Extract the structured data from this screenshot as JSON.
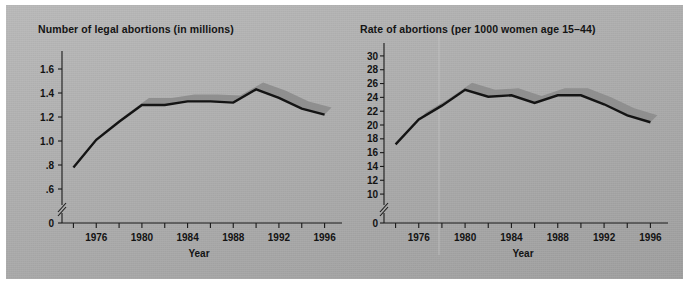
{
  "figure": {
    "background_color": "#b0b0b0",
    "border_color": "#ffffff",
    "line_color": "#141414",
    "ribbon_highlight_color": "#8f8f8f"
  },
  "chart_data": [
    {
      "id": "legal-abortions-count",
      "type": "line",
      "title": "Number of legal abortions (in millions)",
      "xlabel": "Year",
      "ylabel": "",
      "xlim": [
        1973,
        1997
      ],
      "ylim": [
        0.5,
        1.7
      ],
      "grid": false,
      "legend": "none",
      "axis_break_y": true,
      "y_ticks": [
        "0",
        ".6",
        ".8",
        "1.0",
        "1.2",
        "1.4",
        "1.6"
      ],
      "y_tick_values": [
        0,
        0.6,
        0.8,
        1.0,
        1.2,
        1.4,
        1.6
      ],
      "x_ticks": [
        "1976",
        "1980",
        "1984",
        "1988",
        "1992",
        "1996"
      ],
      "x_tick_values": [
        1976,
        1980,
        1984,
        1988,
        1992,
        1996
      ],
      "x_minor_tick_values": [
        1974,
        1978,
        1982,
        1986,
        1990,
        1994
      ],
      "x": [
        1974,
        1976,
        1978,
        1980,
        1982,
        1984,
        1986,
        1988,
        1990,
        1992,
        1994,
        1996
      ],
      "values": [
        0.78,
        1.01,
        1.16,
        1.3,
        1.3,
        1.33,
        1.33,
        1.32,
        1.43,
        1.36,
        1.27,
        1.22
      ]
    },
    {
      "id": "abortion-rate",
      "type": "line",
      "title": "Rate of abortions (per 1000 women age 15–44)",
      "xlabel": "Year",
      "ylabel": "",
      "xlim": [
        1973,
        1997
      ],
      "ylim": [
        9,
        31
      ],
      "grid": false,
      "legend": "none",
      "axis_break_y": true,
      "y_ticks": [
        "0",
        "10",
        "12",
        "14",
        "16",
        "18",
        "20",
        "22",
        "24",
        "26",
        "28",
        "30"
      ],
      "y_tick_values": [
        0,
        10,
        12,
        14,
        16,
        18,
        20,
        22,
        24,
        26,
        28,
        30
      ],
      "x_ticks": [
        "1976",
        "1980",
        "1984",
        "1988",
        "1992",
        "1996"
      ],
      "x_tick_values": [
        1976,
        1980,
        1984,
        1988,
        1992,
        1996
      ],
      "x_minor_tick_values": [
        1974,
        1978,
        1982,
        1986,
        1990,
        1994
      ],
      "x": [
        1974,
        1976,
        1978,
        1980,
        1982,
        1984,
        1986,
        1988,
        1990,
        1992,
        1994,
        1996
      ],
      "values": [
        17.2,
        20.8,
        22.8,
        25.1,
        24.1,
        24.3,
        23.2,
        24.3,
        24.3,
        23.0,
        21.4,
        20.4
      ]
    }
  ]
}
